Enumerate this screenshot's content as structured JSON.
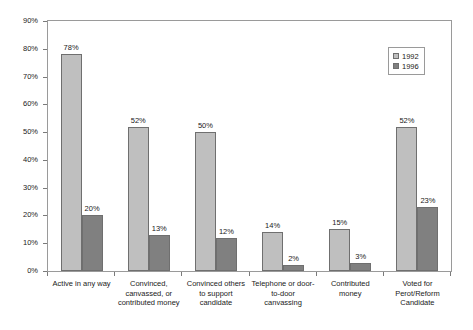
{
  "chart_data": {
    "type": "bar",
    "title": "",
    "xlabel": "",
    "ylabel": "",
    "ylim": [
      0,
      90
    ],
    "ytick_labels": [
      "90%",
      "80%",
      "70%",
      "60%",
      "50%",
      "40%",
      "30%",
      "20%",
      "10%",
      "0%"
    ],
    "ytick_values": [
      90,
      80,
      70,
      60,
      50,
      40,
      30,
      20,
      10,
      0
    ],
    "grid": false,
    "legend_position": "top-right",
    "categories": [
      "Active in any way",
      "Convinced, canvassed, or contributed money",
      "Convinced others to support candidate",
      "Telephone or door-to-door canvassing",
      "Contributed money",
      "Voted for Perot/Reform Candidate"
    ],
    "series": [
      {
        "name": "1992",
        "color": "#bfbfbf",
        "values": [
          78,
          52,
          50,
          14,
          15,
          52
        ],
        "labels": [
          "78%",
          "52%",
          "50%",
          "14%",
          "15%",
          "52%"
        ]
      },
      {
        "name": "1996",
        "color": "#808080",
        "values": [
          20,
          13,
          12,
          2,
          3,
          23
        ],
        "labels": [
          "20%",
          "13%",
          "12%",
          "2%",
          "3%",
          "23%"
        ]
      }
    ]
  }
}
